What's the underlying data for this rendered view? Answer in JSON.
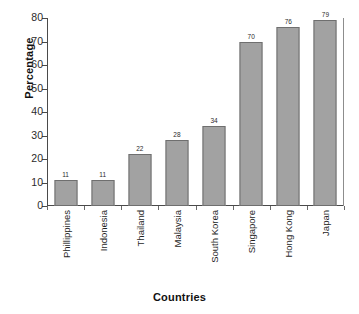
{
  "chart_data": {
    "type": "bar",
    "title": "",
    "xlabel": "Countries",
    "ylabel": "Percentage",
    "categories": [
      "Phillippines",
      "Indonesia",
      "Thailand",
      "Malaysia",
      "South Korea",
      "Singapore",
      "Hong Kong",
      "Japan"
    ],
    "values": [
      11,
      11,
      22,
      28,
      34,
      70,
      76,
      79
    ],
    "value_labels": [
      "11",
      "11",
      "22",
      "28",
      "34",
      "70",
      "76",
      "79"
    ],
    "ylim": [
      0,
      80
    ],
    "ytick_labels": [
      "0",
      "10",
      "20",
      "30",
      "40",
      "50",
      "60",
      "70",
      "80"
    ],
    "ytick_values": [
      0,
      10,
      20,
      30,
      40,
      50,
      60,
      70,
      80
    ],
    "grid": false,
    "legend": null,
    "bar_color": "#a2a2a2",
    "bar_edge_color": "#6f6f6f",
    "axis_color": "#4a4a4a",
    "background_color": "#ffffff"
  }
}
